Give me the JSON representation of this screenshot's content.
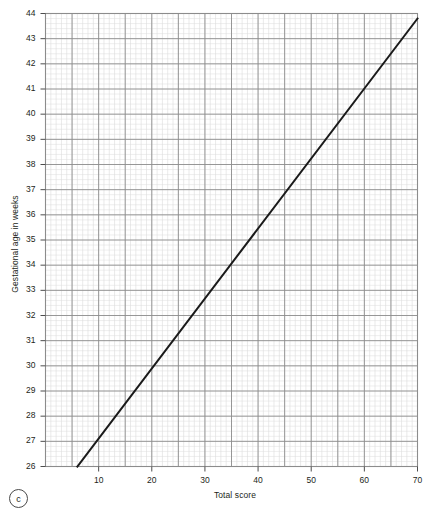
{
  "figure": {
    "panel_tag": "c",
    "background_color": "#ffffff"
  },
  "chart_data": {
    "type": "line",
    "title": "",
    "subtitle": "",
    "xlabel": "Total score",
    "ylabel": "Gestational age in weeks",
    "xlim": [
      0,
      70
    ],
    "ylim": [
      26,
      44
    ],
    "grid": true,
    "legend": null,
    "legend_position": "none",
    "x_ticks_major": [
      10,
      20,
      30,
      40,
      50,
      60,
      70
    ],
    "x_tick_labels": [
      "10",
      "20",
      "30",
      "40",
      "50",
      "60",
      "70"
    ],
    "x_gridlines_major": [
      5,
      10,
      15,
      20,
      25,
      30,
      35,
      40,
      45,
      50,
      55,
      60,
      65,
      70
    ],
    "x_minor_step": 1,
    "y_ticks_major": [
      26,
      27,
      28,
      29,
      30,
      31,
      32,
      33,
      34,
      35,
      36,
      37,
      38,
      39,
      40,
      41,
      42,
      43,
      44
    ],
    "y_tick_labels": [
      "26",
      "27",
      "28",
      "29",
      "30",
      "31",
      "32",
      "33",
      "34",
      "35",
      "36",
      "37",
      "38",
      "39",
      "40",
      "41",
      "42",
      "43",
      "44"
    ],
    "y_minor_step": 0.2,
    "series": [
      {
        "name": "Gestational age vs total score",
        "color": "#1a1a1a",
        "line_width": 2,
        "points": [
          {
            "x": 6.0,
            "y": 26.0
          },
          {
            "x": 70.0,
            "y": 43.8
          }
        ]
      }
    ]
  },
  "colors": {
    "line": "#1a1a1a",
    "grid_major": "#8c8c8c",
    "grid_minor": "#dcdcdc",
    "axis": "#4d4d4d",
    "text": "#231f20"
  }
}
